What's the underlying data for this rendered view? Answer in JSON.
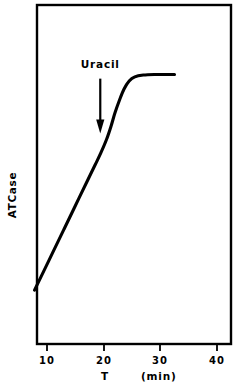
{
  "chart_data": {
    "type": "line",
    "title": "",
    "xlabel": "T",
    "xunits": "(min)",
    "ylabel": "ATCase",
    "xlim": [
      6.1,
      41.0
    ],
    "ylim": [
      0,
      100
    ],
    "xticks": [
      10,
      20,
      30,
      40
    ],
    "xticklabels": [
      "10",
      "20",
      "30",
      "40"
    ],
    "yticks": [],
    "yticklabels": [],
    "grid": false,
    "legend": false,
    "line_color": "#000000",
    "frame_color": "#000000",
    "background_color": "#ffffff",
    "series": [
      {
        "name": "ATCase activity",
        "x": [
          7.8,
          9.0,
          11.0,
          13.0,
          15.0,
          17.0,
          18.5,
          19.5,
          20.5,
          21.3,
          22.0,
          22.8,
          23.6,
          24.5,
          25.5,
          27.0,
          29.0,
          31.0,
          32.5
        ],
        "y": [
          16.8,
          21.5,
          29.4,
          37.3,
          45.2,
          53.1,
          59.0,
          63.0,
          67.5,
          72.0,
          76.5,
          80.8,
          84.5,
          87.2,
          88.6,
          89.2,
          89.4,
          89.4,
          89.4
        ]
      }
    ],
    "annotations": [
      {
        "name": "uracil-arrow",
        "text": "Uracil",
        "x": 19.4,
        "y_text": 93.0,
        "arrow_from_y": 88.0,
        "arrow_to_y": 69.5,
        "arrow_direction": "down"
      }
    ]
  },
  "axes": {
    "y_axis_label": "ATCase",
    "x_axis_label": "T",
    "x_axis_units": "(min)",
    "x_tick_labels": [
      "10",
      "20",
      "30",
      "40"
    ]
  },
  "annotation": {
    "uracil_label": "Uracil"
  }
}
